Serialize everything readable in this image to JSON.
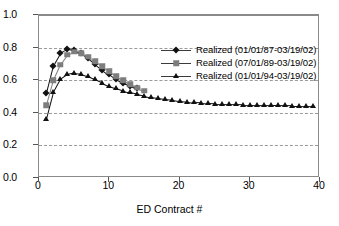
{
  "chart_data": {
    "type": "line",
    "title": "",
    "xlabel": "ED Contract #",
    "ylabel": "",
    "xlim": [
      0,
      40
    ],
    "ylim": [
      0.0,
      1.0
    ],
    "xticks": [
      0,
      10,
      20,
      30,
      40
    ],
    "xtick_labels": [
      "0",
      "10",
      "20",
      "30",
      "40"
    ],
    "yticks": [
      0.0,
      0.2,
      0.4,
      0.6,
      0.8,
      1.0
    ],
    "ytick_labels": [
      "0.0",
      "0.2",
      "0.4",
      "0.6",
      "0.8",
      "1.0"
    ],
    "grid": "horizontal-dashed",
    "legend_position": "upper-right-inside",
    "series": [
      {
        "name": "Realized (01/01/87-03/19/02)",
        "marker": "diamond",
        "color": "#111111",
        "x": [
          1,
          2,
          3,
          4,
          5,
          6,
          7,
          8,
          9,
          10,
          11,
          12,
          13,
          14
        ],
        "values": [
          0.52,
          0.69,
          0.765,
          0.79,
          0.785,
          0.765,
          0.735,
          0.7,
          0.665,
          0.635,
          0.605,
          0.58,
          0.565,
          0.55
        ]
      },
      {
        "name": "Realized (07/01/89-03/19/02)",
        "marker": "square",
        "color": "#7d7d7d",
        "x": [
          1,
          2,
          3,
          4,
          5,
          6,
          7,
          8,
          9,
          10,
          11,
          12,
          13,
          14,
          15
        ],
        "values": [
          0.445,
          0.6,
          0.695,
          0.755,
          0.775,
          0.765,
          0.745,
          0.715,
          0.685,
          0.655,
          0.625,
          0.6,
          0.575,
          0.555,
          0.535
        ]
      },
      {
        "name": "Realized (01/01/94-03/19/02)",
        "marker": "triangle",
        "color": "#111111",
        "x": [
          1,
          2,
          3,
          4,
          5,
          6,
          7,
          8,
          9,
          10,
          11,
          12,
          13,
          14,
          15,
          16,
          17,
          18,
          19,
          20,
          21,
          22,
          23,
          24,
          25,
          26,
          27,
          28,
          29,
          30,
          31,
          32,
          33,
          34,
          35,
          36,
          37,
          38,
          39
        ],
        "values": [
          0.36,
          0.525,
          0.605,
          0.635,
          0.645,
          0.64,
          0.625,
          0.605,
          0.585,
          0.565,
          0.55,
          0.535,
          0.525,
          0.515,
          0.505,
          0.495,
          0.488,
          0.482,
          0.478,
          0.472,
          0.468,
          0.464,
          0.462,
          0.459,
          0.457,
          0.455,
          0.453,
          0.452,
          0.45,
          0.449,
          0.448,
          0.447,
          0.446,
          0.446,
          0.445,
          0.444,
          0.444,
          0.443,
          0.442
        ]
      }
    ]
  }
}
